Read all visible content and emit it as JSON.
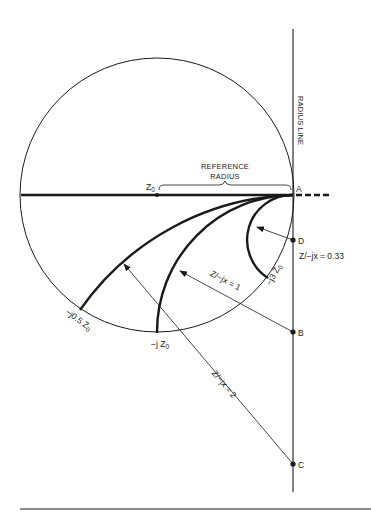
{
  "diagram": {
    "type": "Smith chart construction - reactance circles",
    "colors": {
      "ink": "#1a1a1a",
      "background": "#ffffff"
    },
    "radius_line_label": "RADIUS LINE",
    "reference_radius_label_line1": "REFERENCE",
    "reference_radius_label_line2": "RADIUS",
    "center_label": "Z",
    "center_label_sub": "0",
    "points": {
      "A": "A",
      "B": "B",
      "C": "C",
      "D": "D"
    },
    "curve_labels": {
      "j3": "−j3 Z",
      "j1": "−j Z",
      "j05": "−j0.5 Z",
      "sub": "0"
    },
    "ratio_labels": {
      "d": "Z/−jx = 0.33",
      "b": "Z/−jx = 1",
      "c": "Z/−jx = 2"
    }
  }
}
